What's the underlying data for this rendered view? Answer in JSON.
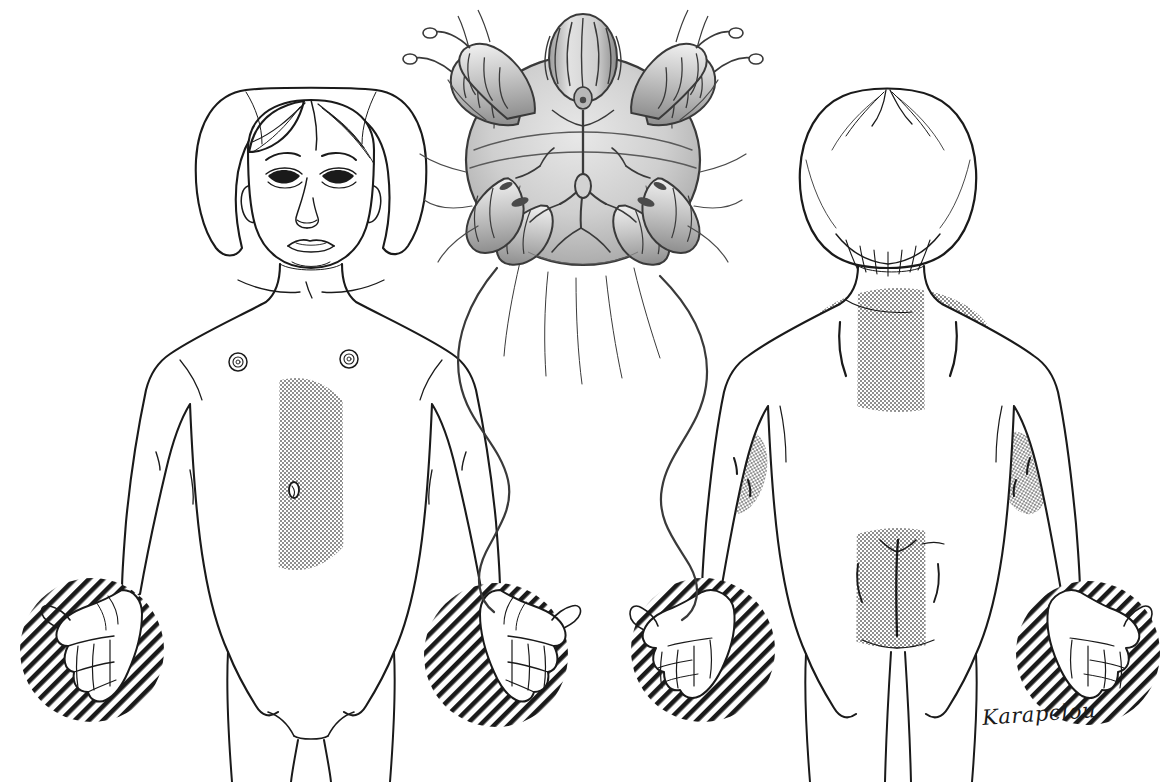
{
  "illustration": {
    "title": "Scabies lesion distribution in a child",
    "subject": "Sarcoptes scabiei mite and typical body distribution of scabies lesions",
    "signature": "Karapelou",
    "background_color": "#ffffff",
    "ink_color": "#1a1a1a",
    "stipple_color": "#9a9a9a",
    "hatch_color": "#1a1a1a",
    "mite_body_fill": "#c9c9c9"
  },
  "figures": [
    {
      "id": "anterior-child",
      "label": "Child, anterior (front) view",
      "view": "anterior",
      "affected_regions": [
        {
          "name": "abdomen-periumbilical",
          "texture": "stipple",
          "shape": "oval"
        },
        {
          "name": "left-hand",
          "texture": "hatch",
          "shape": "circle"
        },
        {
          "name": "right-hand",
          "texture": "hatch",
          "shape": "circle"
        }
      ],
      "anatomy_marks": [
        "areola-left",
        "areola-right",
        "umbilicus",
        "clavicle",
        "sternal-notch"
      ]
    },
    {
      "id": "posterior-child",
      "label": "Child, posterior (back) view",
      "view": "posterior",
      "affected_regions": [
        {
          "name": "upper-back-interscapular",
          "texture": "stipple",
          "shape": "oval"
        },
        {
          "name": "left-elbow",
          "texture": "stipple",
          "shape": "oval"
        },
        {
          "name": "right-elbow",
          "texture": "stipple",
          "shape": "oval"
        },
        {
          "name": "buttocks-gluteal",
          "texture": "stipple",
          "shape": "oval"
        },
        {
          "name": "left-hand",
          "texture": "hatch",
          "shape": "circle"
        },
        {
          "name": "right-hand",
          "texture": "hatch",
          "shape": "circle"
        }
      ],
      "anatomy_marks": [
        "scapular-border-left",
        "scapular-border-right",
        "natal-cleft",
        "gluteal-fold"
      ]
    }
  ],
  "mite": {
    "id": "scabies-mite",
    "label": "Sarcoptes scabiei, ventral view",
    "orientation": "ventral",
    "leg_pairs": 4,
    "anterior_legs_with_suckers": 4,
    "posterior_legs_with_long_setae": 2,
    "parts": [
      "gnathosoma",
      "chelicerae",
      "palps",
      "idiosoma",
      "legs",
      "pretarsal-suckers",
      "setae"
    ]
  }
}
